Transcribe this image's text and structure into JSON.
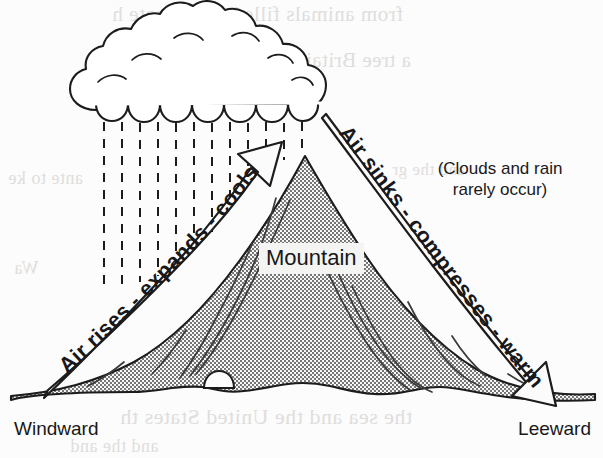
{
  "figure": {
    "background_color": "#fcfcfc",
    "ink_color": "#18181a",
    "mountain_fill": "#b9b9b9",
    "label_box_color": "#f4f4f2"
  },
  "labels": {
    "mountain": "Mountain",
    "note_line1": "(Clouds and rain",
    "note_line2": "rarely occur)",
    "note_full": "(Clouds and rain rarely occur)",
    "windward": "Windward",
    "leeward": "Leeward"
  },
  "arrows": {
    "windward": {
      "text": "Air rises - expands - cools",
      "direction": "up-right",
      "style": "hollow-outline-band"
    },
    "leeward": {
      "text": "Air sinks - compresses - warms",
      "direction": "down-right",
      "style": "hollow-outline-band"
    }
  },
  "elements": {
    "cloud": "rain-cloud",
    "rain": "dashed-rain-lines",
    "mountain": "stippled-mountain",
    "boulder": "small-rock-at-base"
  },
  "bleed_through": {
    "a": "from animals filled the climate  h",
    "b": "a tree Britain and Western Europ",
    "c": "ante to ke",
    "d": "and the gr",
    "e": "Wa",
    "f": "the sea and the United States th",
    "g": "and the and"
  }
}
